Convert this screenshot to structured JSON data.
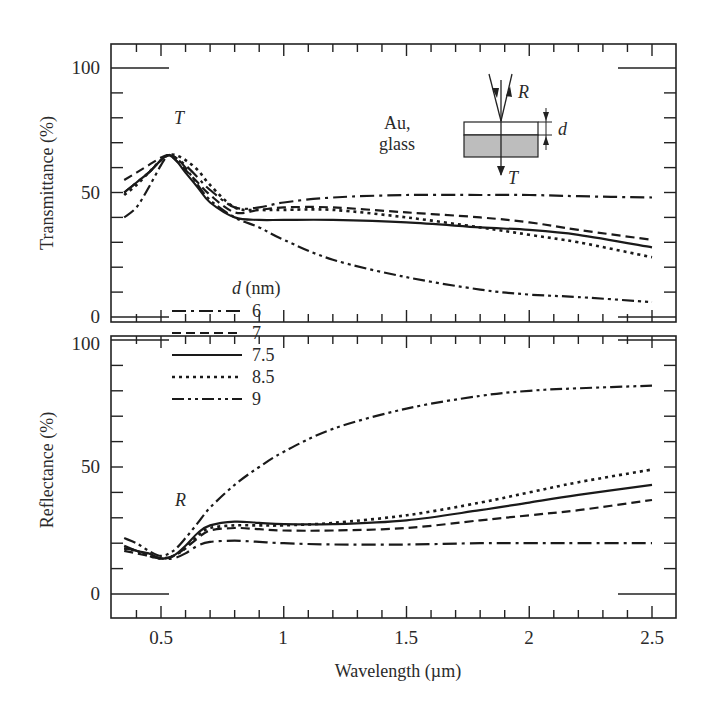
{
  "figure": {
    "panel_top_label": "T",
    "panel_bottom_label": "R",
    "sample_label_line1": "Au,",
    "sample_label_line2": "glass",
    "inset": {
      "reflect_label": "R",
      "transmit_label": "T",
      "thickness_label": "d"
    },
    "legend_title_symbol": "d",
    "legend_title_unit": " (nm)"
  },
  "chart_data": [
    {
      "type": "line",
      "title": "",
      "xlabel": "Wavelength (µm)",
      "ylabel": "Transmittance (%)",
      "xlim": [
        0.3,
        2.6
      ],
      "ylim": [
        0,
        100
      ],
      "xticks": [
        "0.5",
        "1",
        "1.5",
        "2",
        "2.5"
      ],
      "yticks": [
        "0",
        "50",
        "100"
      ],
      "grid": false,
      "annotation": "T",
      "x": [
        0.35,
        0.4,
        0.45,
        0.5,
        0.53,
        0.56,
        0.6,
        0.65,
        0.7,
        0.8,
        0.9,
        1.0,
        1.2,
        1.5,
        1.8,
        2.0,
        2.2,
        2.5
      ],
      "series": [
        {
          "name": "6",
          "dash": "dashdot",
          "values": [
            50,
            54,
            58,
            63,
            65,
            64,
            61,
            56,
            51,
            44,
            44,
            46,
            48,
            49,
            49,
            49,
            48.5,
            48
          ]
        },
        {
          "name": "7",
          "dash": "dashed",
          "values": [
            55,
            58,
            61,
            64,
            65,
            63,
            59,
            54,
            49,
            42,
            43,
            44,
            44,
            42,
            40,
            38,
            35,
            31
          ]
        },
        {
          "name": "7.5",
          "dash": "solid",
          "values": [
            50,
            54,
            58,
            63,
            65,
            63,
            58,
            52,
            46,
            40,
            39,
            39,
            39,
            38,
            36,
            35,
            33,
            28
          ]
        },
        {
          "name": "8.5",
          "dash": "dotted",
          "values": [
            49,
            53,
            58,
            63,
            65,
            65,
            63,
            59,
            53,
            44,
            43,
            43,
            43,
            40,
            36,
            33,
            30,
            24
          ]
        },
        {
          "name": "9",
          "dash": "dashdotdot",
          "values": [
            40,
            44,
            52,
            61,
            65,
            64,
            60,
            53,
            47,
            40,
            36,
            31,
            23,
            16,
            11,
            9,
            8,
            6
          ]
        }
      ]
    },
    {
      "type": "line",
      "title": "",
      "xlabel": "Wavelength (µm)",
      "ylabel": "Reflectance (%)",
      "xlim": [
        0.3,
        2.6
      ],
      "ylim": [
        0,
        100
      ],
      "xticks": [
        "0.5",
        "1",
        "1.5",
        "2",
        "2.5"
      ],
      "yticks": [
        "0",
        "50",
        "100"
      ],
      "grid": false,
      "annotation": "R",
      "x": [
        0.35,
        0.4,
        0.45,
        0.5,
        0.55,
        0.6,
        0.65,
        0.7,
        0.8,
        0.9,
        1.0,
        1.2,
        1.5,
        1.8,
        2.0,
        2.2,
        2.5
      ],
      "series": [
        {
          "name": "6",
          "dash": "dashdot",
          "values": [
            18,
            17,
            15,
            14,
            14,
            16,
            19,
            20.5,
            21,
            20.5,
            20,
            19.5,
            19.5,
            20,
            20,
            20,
            20
          ]
        },
        {
          "name": "7",
          "dash": "dashed",
          "values": [
            17,
            16,
            15,
            14,
            15,
            18,
            22,
            25,
            26,
            25.5,
            25,
            25,
            26,
            29,
            31,
            33,
            37
          ]
        },
        {
          "name": "7.5",
          "dash": "solid",
          "values": [
            19,
            17,
            16,
            14,
            15,
            19,
            24,
            27,
            28.5,
            28,
            27.5,
            27.5,
            29,
            33,
            36,
            39,
            43
          ]
        },
        {
          "name": "8.5",
          "dash": "dotted",
          "values": [
            18,
            17,
            15,
            14,
            15,
            18,
            23,
            26,
            27,
            27,
            27,
            28,
            31,
            36,
            40,
            44,
            49
          ]
        },
        {
          "name": "9",
          "dash": "dashdotdot",
          "values": [
            22,
            20,
            17,
            15,
            17,
            22,
            28,
            34,
            43,
            50,
            56,
            65,
            73,
            78,
            80,
            81,
            82
          ]
        }
      ]
    }
  ]
}
